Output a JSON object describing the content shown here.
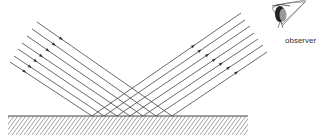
{
  "diagram": {
    "labels": {
      "observer": "observer"
    },
    "surface": {
      "x1": 8,
      "x2": 248,
      "y": 116,
      "hatch_depth": 19
    },
    "rays": {
      "count": 7,
      "incident_starts": [
        [
          37,
          22
        ],
        [
          32,
          29
        ],
        [
          27,
          36
        ],
        [
          22,
          43
        ],
        [
          18,
          49
        ],
        [
          14,
          56
        ],
        [
          10,
          62
        ]
      ],
      "reflection_points_x": [
        172,
        156,
        143,
        130,
        117,
        104,
        92
      ],
      "reflected_ends": [
        [
          267,
          52
        ],
        [
          263,
          45
        ],
        [
          258,
          39
        ],
        [
          254,
          33
        ],
        [
          250,
          26
        ],
        [
          245,
          20
        ],
        [
          241,
          13
        ]
      ]
    },
    "colors": {
      "line": "#444444",
      "background": "#ffffff"
    }
  }
}
